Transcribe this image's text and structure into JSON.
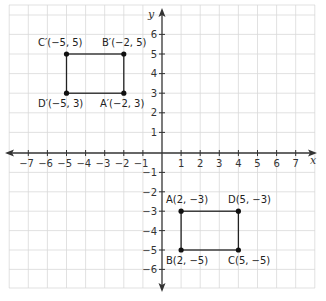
{
  "diagram": {
    "type": "coordinate-plane",
    "axes": {
      "x_label": "x",
      "y_label": "y",
      "x_ticks": [
        "−7",
        "−6",
        "−5",
        "−4",
        "−3",
        "−2",
        "−1",
        "1",
        "2",
        "3",
        "4",
        "5",
        "6",
        "7"
      ],
      "y_ticks": [
        "6",
        "5",
        "4",
        "3",
        "2",
        "1",
        "−1",
        "−2",
        "−3",
        "−4",
        "−5",
        "−6"
      ]
    },
    "rectangles": [
      {
        "name": "ABCD",
        "points": [
          {
            "name": "A",
            "label": "A(2, −3)"
          },
          {
            "name": "D",
            "label": "D(5, −3)"
          },
          {
            "name": "B",
            "label": "B(2, −5)"
          },
          {
            "name": "C",
            "label": "C(5, −5)"
          }
        ]
      },
      {
        "name": "A'B'C'D'",
        "points": [
          {
            "name": "C'",
            "label": "C′(−5, 5)"
          },
          {
            "name": "B'",
            "label": "B′(−2, 5)"
          },
          {
            "name": "D'",
            "label": "D′(−5, 3)"
          },
          {
            "name": "A'",
            "label": "A′(−2, 3)"
          }
        ]
      }
    ]
  }
}
